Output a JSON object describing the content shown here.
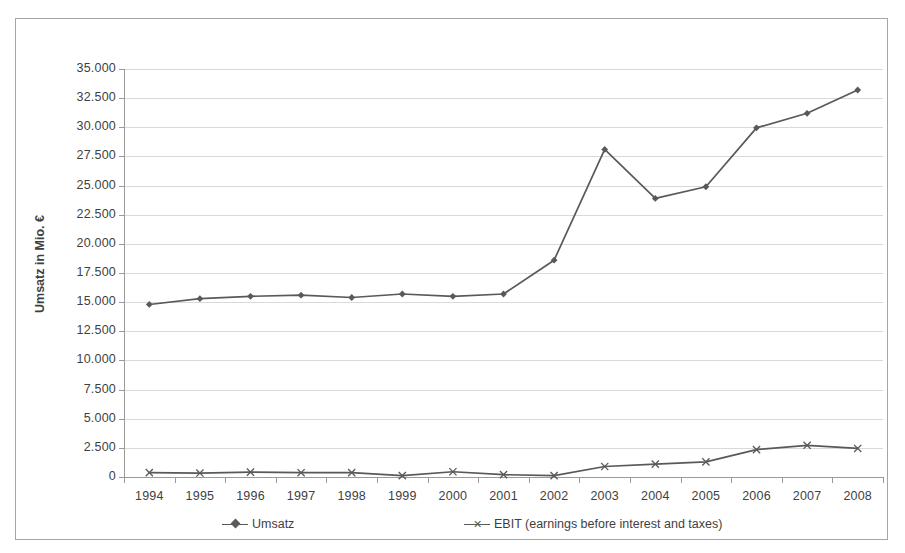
{
  "chart_data": {
    "type": "line",
    "title": "",
    "xlabel": "",
    "ylabel": "Umsatz in Mio. €",
    "ylim": [
      0,
      35000
    ],
    "ytick_step": 2500,
    "grid": true,
    "legend_position": "bottom",
    "categories": [
      "1994",
      "1995",
      "1996",
      "1997",
      "1998",
      "1999",
      "2000",
      "2001",
      "2002",
      "2003",
      "2004",
      "2005",
      "2006",
      "2007",
      "2008"
    ],
    "ytick_labels": [
      "0",
      "2.500",
      "5.000",
      "7.500",
      "10.000",
      "12.500",
      "15.000",
      "17.500",
      "20.000",
      "22.500",
      "25.000",
      "27.500",
      "30.000",
      "32.500",
      "35.000"
    ],
    "series": [
      {
        "name": "Umsatz",
        "marker": "diamond",
        "color": "#595959",
        "values": [
          14800,
          15300,
          15500,
          15600,
          15400,
          15700,
          15500,
          15700,
          18600,
          28100,
          23900,
          24900,
          29950,
          31200,
          33200
        ]
      },
      {
        "name": "EBIT (earnings before interest and taxes)",
        "marker": "x",
        "color": "#595959",
        "values": [
          380,
          340,
          420,
          370,
          380,
          120,
          450,
          200,
          120,
          900,
          1100,
          1300,
          2350,
          2720,
          2450
        ]
      }
    ]
  },
  "legend": {
    "items": [
      {
        "label": "Umsatz",
        "marker": "diamond"
      },
      {
        "label": "EBIT (earnings before interest and taxes)",
        "marker": "x"
      }
    ]
  },
  "axis": {
    "y_title": "Umsatz in Mio. €"
  },
  "colors": {
    "series": "#595959",
    "gridline": "#d9d9d9",
    "axis": "#9a9a9a",
    "text": "#3f3f3f",
    "frame": "#a6a6a6",
    "background": "#ffffff"
  }
}
